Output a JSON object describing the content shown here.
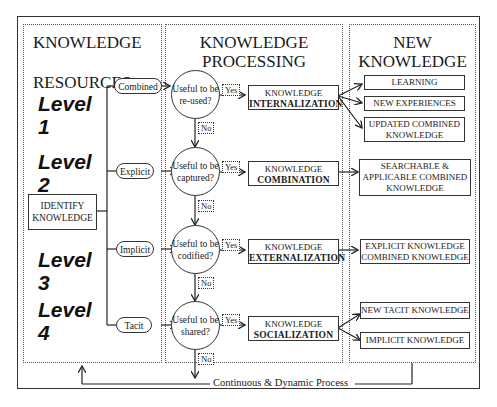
{
  "resources_panel": {
    "title_line1": "KNOWLEDGE",
    "title_line2": "RESOURCES",
    "identify_line1": "IDENTIFY",
    "identify_line2": "KNOWLEDGE",
    "levels": [
      {
        "word": "Level",
        "num": "1",
        "type": "Combined"
      },
      {
        "word": "Level",
        "num": "2",
        "type": "Explicit"
      },
      {
        "word": "Level",
        "num": "3",
        "type": "Implicit"
      },
      {
        "word": "Level",
        "num": "4",
        "type": "Tacit"
      }
    ]
  },
  "processing_panel": {
    "title_line1": "KNOWLEDGE",
    "title_line2": "PROCESSING",
    "decisions": [
      {
        "q1": "Useful to be",
        "q2": "re-used?",
        "yes": "Yes",
        "no": "No",
        "box_top": "KNOWLEDGE",
        "box_bottom": "INTERNALIZATION"
      },
      {
        "q1": "Useful to be",
        "q2": "captured?",
        "yes": "Yes",
        "no": "No",
        "box_top": "KNOWLEDGE",
        "box_bottom": "COMBINATION"
      },
      {
        "q1": "Useful to be",
        "q2": "codified?",
        "yes": "Yes",
        "no": "No",
        "box_top": "KNOWLEDGE",
        "box_bottom": "EXTERNALIZATION"
      },
      {
        "q1": "Useful to be",
        "q2": "shared?",
        "yes": "Yes",
        "no": "No",
        "box_top": "KNOWLEDGE",
        "box_bottom": "SOCIALIZATION"
      }
    ]
  },
  "new_knowledge_panel": {
    "title_line1": "NEW",
    "title_line2": "KNOWLEDGE",
    "outputs": {
      "internalization": [
        {
          "lines": [
            "LEARNING"
          ]
        },
        {
          "lines": [
            "NEW EXPERIENCES"
          ]
        },
        {
          "lines": [
            "UPDATED COMBINED",
            "KNOWLEDGE"
          ]
        }
      ],
      "combination": [
        {
          "lines": [
            "SEARCHABLE &",
            "APPLICABLE COMBINED",
            "KNOWLEDGE"
          ]
        }
      ],
      "externalization": [
        {
          "lines": [
            "EXPLICIT KNOWLEDGE",
            "COMBINED KNOWLEDGE"
          ]
        }
      ],
      "socialization": [
        {
          "lines": [
            "NEW TACIT KNOWLEDGE"
          ]
        },
        {
          "lines": [
            "IMPLICIT KNOWLEDGE"
          ]
        }
      ]
    }
  },
  "footer": {
    "loop_label": "Continuous & Dynamic Process"
  }
}
